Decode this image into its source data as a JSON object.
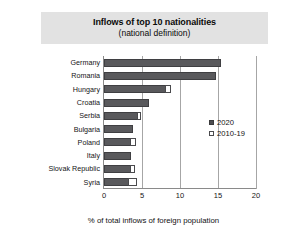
{
  "chart_data": {
    "type": "bar",
    "orientation": "horizontal",
    "stacked": false,
    "title": "Inflows of top 10 nationalities",
    "subtitle": "(national definition)",
    "xlabel": "% of total inflows of foreign population",
    "ylabel": "",
    "xlim": [
      0,
      20
    ],
    "xticks": [
      0,
      5,
      10,
      15,
      20
    ],
    "xtick_labels": [
      "0",
      "5",
      "10",
      "15",
      "20"
    ],
    "grid": true,
    "legend_position": "center-right",
    "categories": [
      "Germany",
      "Romania",
      "Hungary",
      "Croatia",
      "Serbia",
      "Bulgaria",
      "Poland",
      "Italy",
      "Slovak Republic",
      "Syria"
    ],
    "series": [
      {
        "name": "2020",
        "marker": "filled-square",
        "color": "#59595c",
        "values": [
          15.4,
          14.7,
          8.2,
          5.9,
          4.5,
          3.8,
          3.6,
          3.5,
          3.6,
          3.3
        ]
      },
      {
        "name": "2010-19",
        "marker": "open-square",
        "color": "#ffffff",
        "values": [
          15.4,
          14.7,
          8.9,
          5.9,
          5.0,
          3.8,
          4.4,
          3.5,
          4.2,
          4.5
        ]
      }
    ]
  },
  "legend": {
    "entries": [
      {
        "label": "2020"
      },
      {
        "label": "2010-19"
      }
    ]
  },
  "colors": {
    "bar_2020": "#59595c",
    "bar_2010_19": "#ffffff",
    "title_band": "#e2e2e2",
    "gridline": "#a6a6a6",
    "axis": "#8a8a8a"
  }
}
